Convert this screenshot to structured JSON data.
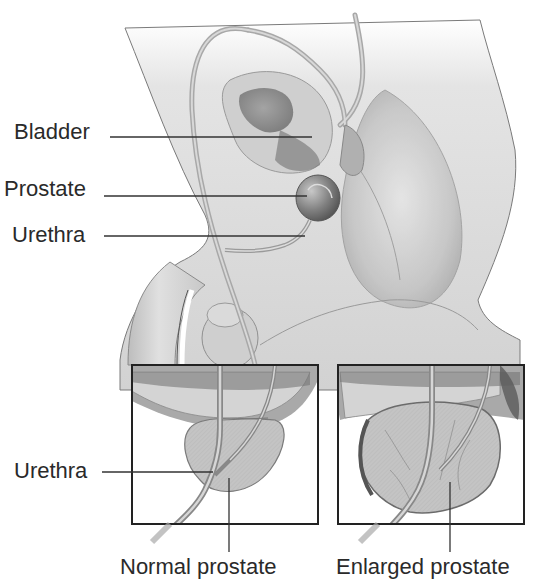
{
  "diagram": {
    "labels": {
      "bladder": "Bladder",
      "prostate": "Prostate",
      "urethra_top": "Urethra",
      "urethra_inset": "Urethra",
      "normal_prostate": "Normal prostate",
      "enlarged_prostate": "Enlarged prostate"
    },
    "insets": [
      {
        "id": "normal",
        "title": "Normal prostate"
      },
      {
        "id": "enlarged",
        "title": "Enlarged prostate"
      }
    ],
    "colors": {
      "ink": "#2a2a2a",
      "line": "#333333",
      "tissue_light": "#d6d6d6",
      "tissue_mid": "#a9a9a9",
      "tissue_dark": "#6f6f6f",
      "background": "#ffffff"
    }
  }
}
